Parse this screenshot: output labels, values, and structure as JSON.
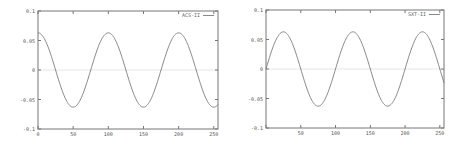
{
  "chart_data": [
    {
      "type": "line",
      "title": "",
      "xlabel": "",
      "ylabel": "",
      "xlim": [
        0,
        256
      ],
      "ylim": [
        -0.1,
        0.1
      ],
      "xticks": [
        "0",
        "50",
        "100",
        "150",
        "200",
        "250"
      ],
      "yticks": [
        "0.1",
        "0.05",
        "0",
        "-0.05",
        "-0.1"
      ],
      "grid": false,
      "legend_position": "top-right",
      "series": [
        {
          "name": "ACS-II",
          "function": "0.063*cos(2*pi*x/100)",
          "x": [
            0,
            25,
            50,
            75,
            100,
            125,
            150,
            175,
            200,
            225,
            250
          ],
          "values": [
            0.063,
            0.0,
            -0.063,
            0.0,
            0.063,
            0.0,
            -0.063,
            0.0,
            0.063,
            0.0,
            -0.063
          ],
          "color": "#888888"
        }
      ],
      "reference_line": {
        "y": 0,
        "color": "#e6e6e6"
      }
    },
    {
      "type": "line",
      "title": "",
      "xlabel": "",
      "ylabel": "",
      "xlim": [
        0,
        256
      ],
      "ylim": [
        -0.1,
        0.1
      ],
      "xticks": [
        "50",
        "100",
        "150",
        "200",
        "250"
      ],
      "yticks": [
        "0.1",
        "0.05",
        "0",
        "-0.05",
        "-0.1"
      ],
      "grid": false,
      "legend_position": "top-right",
      "series": [
        {
          "name": "SXT-II",
          "function": "0.063*sin(2*pi*x/100)",
          "x": [
            0,
            25,
            50,
            75,
            100,
            125,
            150,
            175,
            200,
            225,
            250
          ],
          "values": [
            0.0,
            0.063,
            0.0,
            -0.063,
            0.0,
            0.063,
            0.0,
            -0.063,
            0.0,
            0.063,
            0.0
          ],
          "color": "#888888"
        }
      ],
      "reference_line": {
        "y": 0,
        "color": "#e6e6e6"
      }
    }
  ],
  "plots": [
    {
      "legend": "ACS-II",
      "xticks": [
        "0",
        "50",
        "100",
        "150",
        "200",
        "250"
      ],
      "yticks": [
        "0.1",
        "0.05",
        "0",
        "-0.05",
        "-0.1"
      ]
    },
    {
      "legend": "SXT-II",
      "xticks": [
        "",
        "50",
        "100",
        "150",
        "200",
        "250"
      ],
      "yticks": [
        "0.1",
        "0.05",
        "0",
        "-0.05",
        "-0.1"
      ]
    }
  ],
  "colors": {
    "frame": "#777777",
    "curve": "#888888",
    "zero_line": "#e6e6e6",
    "text": "#555555"
  }
}
